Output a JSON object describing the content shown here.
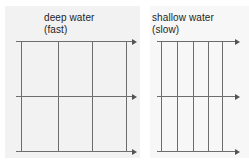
{
  "figure": {
    "background_color": "#ffffff",
    "line_color": "#6d6d6d",
    "arrow_color": "#545454",
    "plate_color": "#f2f2f2",
    "width": 249,
    "height": 162
  },
  "panels": [
    {
      "id": "deep-water",
      "label_line1": "deep water",
      "label_line2": "(fast)",
      "label_x": 44,
      "label_y": 12,
      "plate": {
        "x": 5,
        "y": 6,
        "width": 135,
        "height": 152
      },
      "wavefront_x": [
        21,
        58,
        92,
        126
      ],
      "wavefront_top": 41,
      "wavefront_bottom": 151,
      "wavelength_px": 36,
      "ray_y": [
        41,
        96,
        151
      ],
      "ray_x_start": 16,
      "ray_x_end": 132
    },
    {
      "id": "shallow-water",
      "label_line1": "shallow water",
      "label_line2": "(slow)",
      "label_x": 152,
      "label_y": 12,
      "plate": {
        "x": 150,
        "y": 6,
        "width": 99,
        "height": 152
      },
      "wavefront_x": [
        161,
        177,
        193,
        208,
        222
      ],
      "wavefront_top": 41,
      "wavefront_bottom": 151,
      "wavelength_px": 15,
      "ray_y": [
        41,
        96,
        151
      ],
      "ray_x_start": 157,
      "ray_x_end": 235
    }
  ],
  "chart_data": {
    "type": "diagram",
    "series": [
      {
        "name": "deep water (fast)",
        "wavefront_count": 4,
        "wavelength_relative": 1.0,
        "speed": "fast",
        "ray_count": 3
      },
      {
        "name": "shallow water (slow)",
        "wavefront_count": 5,
        "wavelength_relative": 0.42,
        "speed": "slow",
        "ray_count": 3
      }
    ],
    "annotations": [
      "deep water",
      "(fast)",
      "shallow water",
      "(slow)"
    ]
  }
}
